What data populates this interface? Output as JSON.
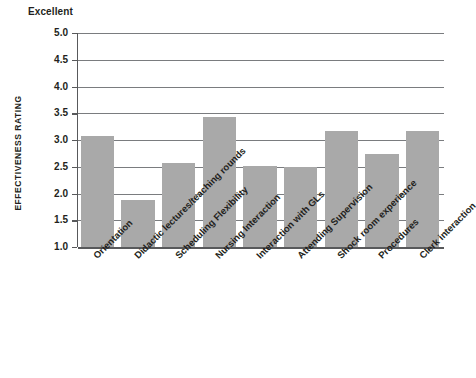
{
  "chart_data": {
    "type": "bar",
    "title": "",
    "xlabel": "",
    "ylabel": "EFFECTIVENESS RATING",
    "top_scale_anchor": "Excellent",
    "ylim": [
      1.0,
      5.0
    ],
    "yticks": [
      "5.0",
      "4.5",
      "4.0",
      "3.5",
      "3.0",
      "2.5",
      "2.0",
      "1.5",
      "1.0"
    ],
    "ytick_values": [
      5.0,
      4.5,
      4.0,
      3.5,
      3.0,
      2.5,
      2.0,
      1.5,
      1.0
    ],
    "grid": true,
    "legend": false,
    "bar_color": "#a9a9a9",
    "axis_color": "#58595b",
    "categories": [
      "Orientation",
      "Didactic lectures/teaching rounds",
      "Scheduling Flexibility",
      "Nursing Interaction",
      "Interaction with GLs",
      "Attending Supervision",
      "Shock room experience",
      "Procedures",
      "Clerk interaction"
    ],
    "values": [
      3.08,
      1.88,
      2.57,
      3.43,
      2.51,
      2.5,
      3.17,
      2.73,
      3.17
    ]
  }
}
